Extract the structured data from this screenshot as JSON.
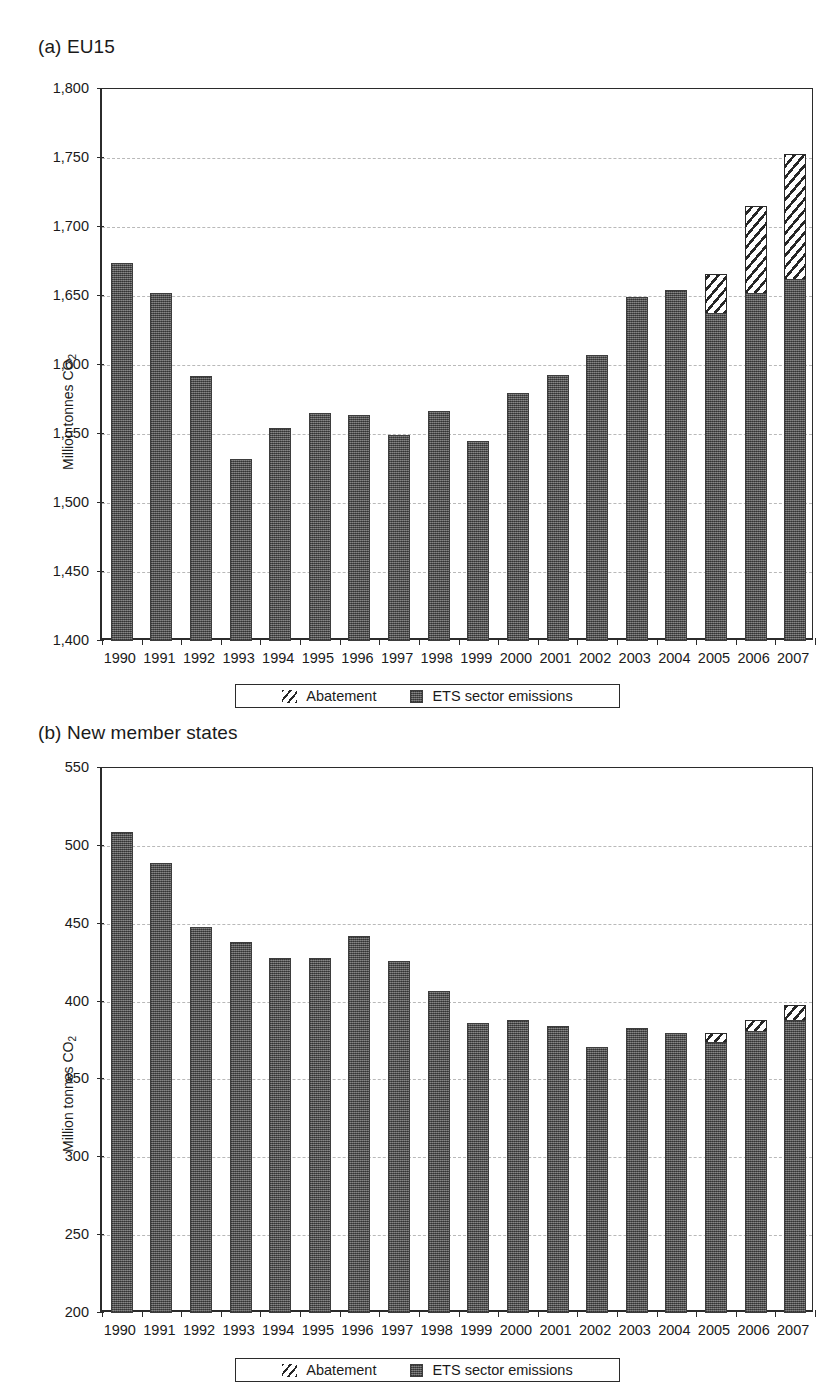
{
  "figure": {
    "ylabel_text": "Million tonnes CO",
    "ylabel_sub": "2"
  },
  "legend": {
    "abatement_label": "Abatement",
    "ets_label": "ETS sector emissions"
  },
  "panels": [
    {
      "id": "a",
      "title": "(a) EU15",
      "ylabel": "Million tonnes CO2"
    },
    {
      "id": "b",
      "title": "(b) New member states",
      "ylabel": "Million tonnes CO2"
    }
  ],
  "chart_data": [
    {
      "type": "bar",
      "title": "(a) EU15",
      "xlabel": "",
      "ylabel": "Million tonnes CO2",
      "ylim": [
        1400,
        1800
      ],
      "yticks": [
        1400,
        1450,
        1500,
        1550,
        1600,
        1650,
        1700,
        1750,
        1800
      ],
      "ytick_labels": [
        "1,400",
        "1,450",
        "1,500",
        "1,550",
        "1,600",
        "1,650",
        "1,700",
        "1,750",
        "1,800"
      ],
      "grid": true,
      "legend_position": "below",
      "categories": [
        "1990",
        "1991",
        "1992",
        "1993",
        "1994",
        "1995",
        "1996",
        "1997",
        "1998",
        "1999",
        "2000",
        "2001",
        "2002",
        "2003",
        "2004",
        "2005",
        "2006",
        "2007"
      ],
      "series": [
        {
          "name": "ETS sector emissions",
          "values": [
            1674,
            1652,
            1592,
            1532,
            1554,
            1565,
            1564,
            1549,
            1567,
            1545,
            1580,
            1593,
            1607,
            1649,
            1654,
            1638,
            1652,
            1662
          ]
        },
        {
          "name": "Abatement",
          "values": [
            0,
            0,
            0,
            0,
            0,
            0,
            0,
            0,
            0,
            0,
            0,
            0,
            0,
            0,
            0,
            28,
            63,
            91
          ]
        }
      ],
      "stacked_totals": [
        1674,
        1652,
        1592,
        1532,
        1554,
        1565,
        1564,
        1549,
        1567,
        1545,
        1580,
        1593,
        1607,
        1649,
        1654,
        1666,
        1715,
        1753
      ]
    },
    {
      "type": "bar",
      "title": "(b) New member states",
      "xlabel": "",
      "ylabel": "Million tonnes CO2",
      "ylim": [
        200,
        550
      ],
      "yticks": [
        200,
        250,
        300,
        350,
        400,
        450,
        500,
        550
      ],
      "ytick_labels": [
        "200",
        "250",
        "300",
        "350",
        "400",
        "450",
        "500",
        "550"
      ],
      "grid": true,
      "legend_position": "below",
      "categories": [
        "1990",
        "1991",
        "1992",
        "1993",
        "1994",
        "1995",
        "1996",
        "1997",
        "1998",
        "1999",
        "2000",
        "2001",
        "2002",
        "2003",
        "2004",
        "2005",
        "2006",
        "2007"
      ],
      "series": [
        {
          "name": "ETS sector emissions",
          "values": [
            509,
            489,
            448,
            438,
            428,
            428,
            442,
            426,
            407,
            386,
            388,
            384,
            371,
            383,
            380,
            374,
            381,
            388
          ]
        },
        {
          "name": "Abatement",
          "values": [
            0,
            0,
            0,
            0,
            0,
            0,
            0,
            0,
            0,
            0,
            0,
            0,
            0,
            0,
            0,
            6,
            7,
            10
          ]
        }
      ],
      "stacked_totals": [
        509,
        489,
        448,
        438,
        428,
        428,
        442,
        426,
        407,
        386,
        388,
        384,
        371,
        383,
        380,
        380,
        388,
        398
      ]
    }
  ]
}
